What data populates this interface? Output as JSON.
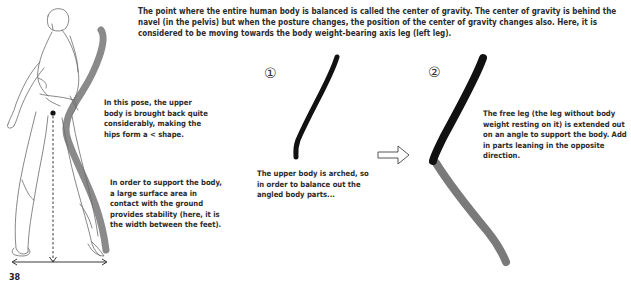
{
  "intro": {
    "text": "The point where the entire human body is balanced is called the center of gravity. The center of gravity is behind the navel (in the pelvis) but when the posture changes, the position of the center of gravity changes also. Here, it is considered to be moving towards the body weight-bearing axis leg (left leg)."
  },
  "figure": {
    "note_pose": "In this pose, the upper body is brought back quite considerably, making the hips form a < shape.",
    "note_support": "In order to support the body, a large surface area in contact with the ground provides stability (here, it is the width between the feet)."
  },
  "step1": {
    "number": "①",
    "caption": "The upper body is arched, so in order to balance out the angled body parts..."
  },
  "step2": {
    "number": "②",
    "caption": "The free leg (the leg without body weight resting on it) is extended out on an angle to support the body. Add in parts leaning in the opposite direction."
  },
  "page_number": "38",
  "colors": {
    "black_stroke": "#111111",
    "gray_stroke": "#7a7a7a",
    "line_art": "#6a6a6a"
  }
}
